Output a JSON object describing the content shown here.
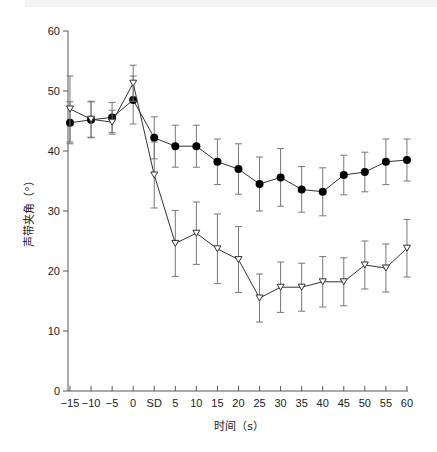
{
  "chart_data": {
    "type": "line",
    "title": "",
    "xlabel": "时间（s）",
    "ylabel": "声带夹角（°）",
    "ylim": [
      0,
      60
    ],
    "yticks": [
      0,
      10,
      20,
      30,
      40,
      50,
      60
    ],
    "categories": [
      "-15",
      "-10",
      "-5",
      "0",
      "SD",
      "5",
      "10",
      "15",
      "20",
      "25",
      "30",
      "35",
      "40",
      "45",
      "50",
      "55",
      "60"
    ],
    "grid": false,
    "legend": null,
    "series": [
      {
        "name": "filled-circle series",
        "marker": "filled-circle",
        "values": [
          44.7,
          45.2,
          45.6,
          48.5,
          42.2,
          40.8,
          40.8,
          38.2,
          37.0,
          34.5,
          35.6,
          33.6,
          33.2,
          36.0,
          36.5,
          38.2,
          38.5
        ],
        "errors": [
          3.5,
          3.0,
          2.5,
          4.0,
          3.5,
          3.5,
          3.5,
          3.8,
          4.2,
          4.5,
          4.8,
          3.8,
          4.0,
          3.3,
          3.3,
          3.8,
          3.5
        ]
      },
      {
        "name": "open-triangle series",
        "marker": "open-triangle",
        "values": [
          47.0,
          45.3,
          44.8,
          51.3,
          36.0,
          24.6,
          26.3,
          23.7,
          21.9,
          15.5,
          17.3,
          17.3,
          18.2,
          18.2,
          21.0,
          20.5,
          23.8
        ],
        "errors": [
          5.5,
          3.0,
          2.0,
          3.0,
          5.5,
          5.5,
          5.2,
          5.8,
          5.5,
          4.0,
          4.2,
          4.0,
          4.2,
          4.0,
          4.0,
          4.0,
          4.8
        ]
      }
    ]
  }
}
